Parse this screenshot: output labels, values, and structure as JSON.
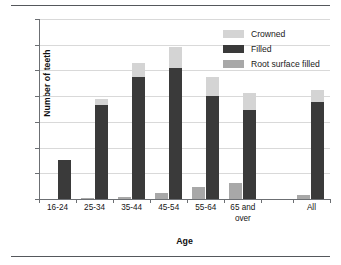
{
  "chart_data": {
    "type": "bar",
    "title": "",
    "subtitle": "",
    "xlabel": "Age",
    "ylabel": "Number of teeth",
    "ylim": [
      0,
      14
    ],
    "yticks": [
      0,
      2,
      4,
      6,
      8,
      10,
      12,
      14
    ],
    "grid": true,
    "legend_position": "top-right",
    "grouping": "grouped-with-stacked-filled-crowned",
    "categories": [
      "16-24",
      "25-34",
      "35-44",
      "45-54",
      "55-64",
      "65 and\nover",
      "All"
    ],
    "category_labels_flat": [
      "16-24",
      "25-34",
      "35-44",
      "45-54",
      "55-64",
      "65 and over",
      "All"
    ],
    "series": [
      {
        "name": "Root surface filled",
        "color": "#a8a8a8",
        "values": [
          0.0,
          0.05,
          0.15,
          0.45,
          0.95,
          1.25,
          0.3
        ]
      },
      {
        "name": "Filled",
        "color": "#3a3a3a",
        "values": [
          3.0,
          7.3,
          9.5,
          10.2,
          8.0,
          6.95,
          7.55
        ]
      },
      {
        "name": "Crowned",
        "color": "#d4d4d4",
        "values": [
          0.0,
          0.5,
          1.1,
          1.6,
          1.5,
          1.3,
          0.95
        ]
      }
    ],
    "stack_totals_filled_plus_crowned": [
      3.0,
      7.8,
      10.6,
      11.8,
      9.5,
      8.25,
      8.5
    ]
  },
  "legend": {
    "items": [
      {
        "label": "Crowned",
        "color": "#d4d4d4"
      },
      {
        "label": "Filled",
        "color": "#3a3a3a"
      },
      {
        "label": "Root surface filled",
        "color": "#a8a8a8"
      }
    ]
  },
  "axes": {
    "y_label": "Number of teeth",
    "x_label": "Age",
    "y_ticks": [
      "0",
      "2",
      "4",
      "6",
      "8",
      "10",
      "12",
      "14"
    ]
  },
  "colors": {
    "crowned": "#d4d4d4",
    "filled": "#3a3a3a",
    "root_surface_filled": "#a8a8a8",
    "gridline": "#d9d9d9",
    "axis": "#6c6f73",
    "rule": "#55585c",
    "background": "#ffffff"
  }
}
